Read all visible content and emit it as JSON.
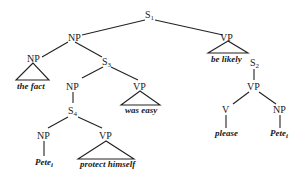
{
  "diagram": {
    "type": "syntax-tree",
    "nodes": {
      "s1": {
        "label": "S",
        "sub": "1"
      },
      "np_top": {
        "label": "NP"
      },
      "vp_top": {
        "label": "VP"
      },
      "np_fact": {
        "label": "NP"
      },
      "s3": {
        "label": "S",
        "sub": "3"
      },
      "np_s3": {
        "label": "NP"
      },
      "vp_s3": {
        "label": "VP"
      },
      "s4": {
        "label": "S",
        "sub": "4"
      },
      "np_s4": {
        "label": "NP"
      },
      "vp_s4": {
        "label": "VP"
      },
      "s2": {
        "label": "S",
        "sub": "2"
      },
      "vp_s2": {
        "label": "VP"
      },
      "v_s2": {
        "label": "V"
      },
      "np_s2": {
        "label": "NP"
      }
    },
    "terminals": {
      "the_fact": "the fact",
      "was_easy": "was easy",
      "be_likely": "be likely",
      "pete_1": {
        "text": "Pete",
        "sub": "i"
      },
      "protect_himself": "protect himself",
      "please": "please",
      "pete_2": {
        "text": "Pete",
        "sub": "i"
      }
    }
  }
}
